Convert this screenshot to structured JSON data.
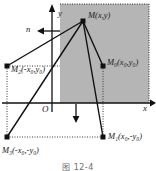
{
  "figure": {
    "caption": "图 12-4",
    "axes": {
      "x_label": "x",
      "y_label": "y",
      "origin_label": "O"
    },
    "normal_marker": {
      "label": "n",
      "direction": "left-arrow"
    },
    "flux_marker": {
      "direction": "down-arrow"
    },
    "points": [
      {
        "key": "M",
        "label_main": "M",
        "sub": "",
        "coords": "(x,y)",
        "x": 83,
        "y": 21,
        "label_x": 88,
        "label_y": 14
      },
      {
        "key": "M0",
        "label_main": "M",
        "sub": "0",
        "coords": "(x₀,y₀)",
        "x": 103,
        "y": 66,
        "label_x": 107,
        "label_y": 60
      },
      {
        "key": "M2",
        "label_main": "M",
        "sub": "2",
        "coords": "(-x₀,y₀)",
        "x": 7,
        "y": 66,
        "label_x": 10,
        "label_y": 66
      },
      {
        "key": "M1",
        "label_main": "M",
        "sub": "1",
        "coords": "(x₀,-y₀)",
        "x": 103,
        "y": 137,
        "label_x": 108,
        "label_y": 133
      },
      {
        "key": "M3",
        "label_main": "M",
        "sub": "3",
        "coords": "(-x₀,-y₀)",
        "x": 7,
        "y": 137,
        "label_x": 3,
        "label_y": 146
      }
    ],
    "labels": {
      "M_text": "M(x,y)",
      "M0_text": "M₀(x₀,y₀)",
      "M2_text": "M₂(-x₀,y₀)",
      "M1_text": "M₁(x₀,-y₀)",
      "M3_text": "M₃(-x₀,-y₀)"
    },
    "colors": {
      "shaded_region": "#b5b5b5",
      "stroke": "#111111",
      "background": "#ffffff",
      "caption": "#6e6e6e"
    },
    "geometry": {
      "origin_x": 52,
      "origin_y": 103,
      "shade_left": 60,
      "shade_top": 4,
      "shade_right": 149,
      "shade_bottom": 103
    }
  }
}
